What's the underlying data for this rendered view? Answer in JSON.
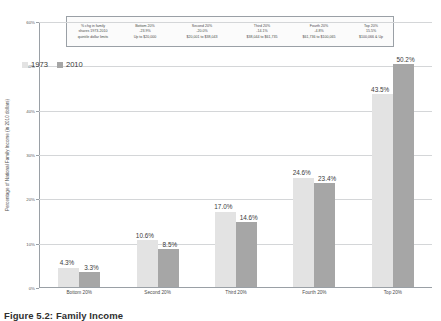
{
  "chart_data": {
    "type": "bar",
    "title": "",
    "xlabel": "",
    "ylabel": "Percentage of National Family Income (in 2010 dollars)",
    "categories": [
      "Bottom 20%",
      "Second 20%",
      "Third 20%",
      "Fourth 20%",
      "Top 20%"
    ],
    "series": [
      {
        "name": "1973",
        "color": "#e3e3e3",
        "values": [
          4.3,
          10.6,
          17.0,
          24.6,
          43.5
        ],
        "labels": [
          "4.3%",
          "10.6%",
          "17.0%",
          "24.6%",
          "43.5%"
        ]
      },
      {
        "name": "2010",
        "color": "#a6a6a6",
        "values": [
          3.3,
          8.5,
          14.6,
          23.4,
          50.2
        ],
        "labels": [
          "3.3%",
          "8.5%",
          "14.6%",
          "23.4%",
          "50.2%"
        ]
      }
    ],
    "ylim": [
      0,
      60
    ],
    "yticks": [
      0,
      10,
      20,
      30,
      40,
      50,
      60
    ],
    "ytick_labels": [
      "0%",
      "10%",
      "20%",
      "30%",
      "40%",
      "50%",
      "60%"
    ],
    "grid": true,
    "legend_position": "upper-left"
  },
  "table": {
    "row_labels": [
      "% chg in family",
      "shares  1973-2010",
      "quintile dollar limits"
    ],
    "columns": [
      {
        "header": "Bottom 20%",
        "change": "-23.9%",
        "limits": "Up to $20,000"
      },
      {
        "header": "Second 20%",
        "change": "-20.0%",
        "limits": "$20,001 to $38,043"
      },
      {
        "header": "Third 20%",
        "change": "-14.1%",
        "limits": "$38,044 to $61,735"
      },
      {
        "header": "Fourth 20%",
        "change": "-4.8%",
        "limits": "$61,736 to $100,065"
      },
      {
        "header": "Top 20%",
        "change": "15.5%",
        "limits": "$100,066 & Up"
      }
    ]
  },
  "caption": "Figure 5.2: Family Income",
  "colors": {
    "series_1973": "#e3e3e3",
    "series_2010": "#a6a6a6",
    "grid": "#d4d6d8",
    "axis": "#9aa0a6",
    "table_border": "#9aa0a6"
  }
}
